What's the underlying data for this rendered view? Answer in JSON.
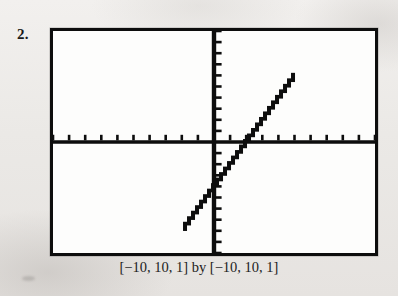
{
  "figure": {
    "problem_number": "2.",
    "caption": "[−10, 10, 1] by [−10, 10, 1]",
    "frame_color": "#0d0d0d",
    "screen_background": "#fdfdfc",
    "page_background": "#eceae7"
  },
  "chart_data": {
    "type": "line",
    "title": "",
    "subtitle": "",
    "xlabel": "",
    "ylabel": "",
    "xlim": [
      -10,
      10
    ],
    "ylim": [
      -10,
      10
    ],
    "xtick_step": 1,
    "ytick_step": 1,
    "grid": false,
    "legend": null,
    "axes_style": "calculator-screen-axes-with-tick-marks",
    "window_notation": "[−10, 10, 1] by [−10, 10, 1]",
    "x_tick_values": [
      -10,
      -9,
      -8,
      -7,
      -6,
      -5,
      -4,
      -3,
      -2,
      -1,
      0,
      1,
      2,
      3,
      4,
      5,
      6,
      7,
      8,
      9,
      10
    ],
    "y_tick_values": [
      -10,
      -9,
      -8,
      -7,
      -6,
      -5,
      -4,
      -3,
      -2,
      -1,
      0,
      1,
      2,
      3,
      4,
      5,
      6,
      7,
      8,
      9,
      10
    ],
    "series": [
      {
        "name": "line",
        "type": "line",
        "slope": 2,
        "intercept": -4,
        "x_intercept": 2,
        "y_intercept": -4,
        "rendering": "pixelated-staircase",
        "x": [
          -1.8,
          5
        ],
        "values": [
          -7.6,
          6
        ]
      }
    ],
    "annotations": []
  }
}
